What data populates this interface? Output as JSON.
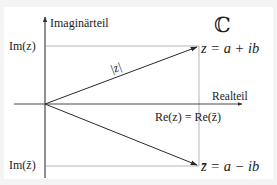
{
  "diagram": {
    "title_symbol": "ℂ",
    "axes": {
      "imaginary_label": "Imaginärteil",
      "real_label": "Realteil"
    },
    "labels": {
      "im_z": "Im(z)",
      "im_zbar": "Im(z̄)",
      "re_equal": "Re(z) = Re(z̄)",
      "modulus": "|z|",
      "z_def": "z = a + ib",
      "zbar_def": "z̄ = a − ib"
    },
    "colors": {
      "axis": "#333333",
      "guide": "#9a9a9a",
      "vector": "#2a2a2a",
      "text": "#222222",
      "background": "#ffffff",
      "frame": "#f4f4f4"
    }
  }
}
